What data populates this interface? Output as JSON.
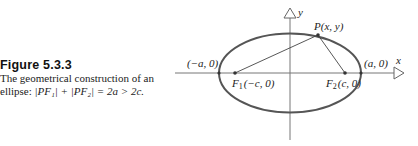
{
  "caption": {
    "label": "Figure  5.3.3",
    "line1": "The geometrical construction of an",
    "line2_prefix": "ellipse: ",
    "formula": "|PF₁| + |PF₂| = 2a > 2c."
  },
  "diagram": {
    "axis_x_label": "x",
    "axis_y_label": "y",
    "point_P": "P(x, y)",
    "left_vertex": "(−a, 0)",
    "right_vertex": "(a, 0)",
    "focus1_name": "F",
    "focus1_sub": "1",
    "focus1_coords": "(−c, 0)",
    "focus2_name": "F",
    "focus2_sub": "2",
    "focus2_coords": "(c, 0)",
    "colors": {
      "ellipse": "#555555",
      "axes": "#666666",
      "lines": "#444444"
    }
  }
}
